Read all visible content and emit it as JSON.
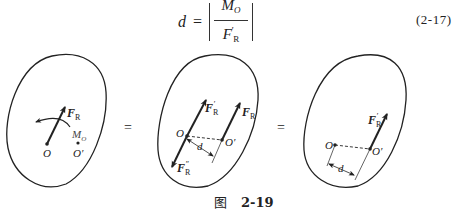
{
  "equation": {
    "lhs": "d",
    "equals": "=",
    "numerator_base": "M",
    "numerator_sub": "O",
    "denominator_base": "F",
    "denominator_prime": "′",
    "denominator_sub": "R",
    "number": "(2-17)"
  },
  "figure": {
    "equals_sign": "=",
    "panel1": {
      "force_label": "F",
      "force_sub": "R",
      "moment_label": "M",
      "moment_sub": "O",
      "point_o": "O",
      "point_o_prime": "O′"
    },
    "panel2": {
      "force_prime_label": "F",
      "force_prime_sub": "R",
      "force_prime_sup": "′",
      "force_label": "F",
      "force_sub": "R",
      "force_double_prime_label": "F",
      "force_double_prime_sub": "R",
      "force_double_prime_sup": "″",
      "point_o": "O",
      "point_o_prime": "O′",
      "distance": "d"
    },
    "panel3": {
      "force_prime_label": "F",
      "force_prime_sub": "R",
      "force_prime_sup": "′",
      "point_o": "O",
      "point_o_prime": "O′",
      "distance": "d"
    },
    "colors": {
      "stroke": "#222222",
      "background": "#ffffff"
    }
  },
  "caption": {
    "prefix": "图",
    "number": "2-19"
  }
}
